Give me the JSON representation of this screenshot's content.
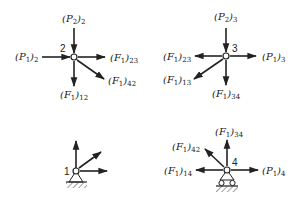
{
  "diagram": {
    "type": "free-body joint diagrams",
    "joints": [
      {
        "id": "2",
        "label": "2",
        "forces": [
          {
            "sym": "P",
            "idx": "2",
            "sub": "2",
            "dir": "in-from-top"
          },
          {
            "sym": "P",
            "idx": "1",
            "sub": "2",
            "dir": "in-from-left"
          },
          {
            "sym": "F",
            "idx": "1",
            "sub": "23",
            "dir": "out-right"
          },
          {
            "sym": "F",
            "idx": "1",
            "sub": "12",
            "dir": "out-down"
          },
          {
            "sym": "F",
            "idx": "1",
            "sub": "42",
            "dir": "out-down-right"
          }
        ]
      },
      {
        "id": "3",
        "label": "3",
        "forces": [
          {
            "sym": "P",
            "idx": "2",
            "sub": "3",
            "dir": "in-from-top"
          },
          {
            "sym": "P",
            "idx": "1",
            "sub": "3",
            "dir": "out-right"
          },
          {
            "sym": "F",
            "idx": "1",
            "sub": "23",
            "dir": "out-left"
          },
          {
            "sym": "F",
            "idx": "1",
            "sub": "13",
            "dir": "out-down-left"
          },
          {
            "sym": "F",
            "idx": "1",
            "sub": "34",
            "dir": "out-down"
          }
        ]
      },
      {
        "id": "1",
        "label": "1",
        "support": "pin",
        "forces": [
          {
            "dir": "out-up"
          },
          {
            "dir": "out-up-right"
          },
          {
            "dir": "out-right"
          }
        ]
      },
      {
        "id": "4",
        "label": "4",
        "support": "roller",
        "forces": [
          {
            "sym": "F",
            "idx": "1",
            "sub": "34",
            "dir": "out-up"
          },
          {
            "sym": "F",
            "idx": "1",
            "sub": "42",
            "dir": "out-up-left"
          },
          {
            "sym": "F",
            "idx": "1",
            "sub": "14",
            "dir": "out-left"
          },
          {
            "sym": "P",
            "idx": "1",
            "sub": "4",
            "dir": "out-right"
          }
        ]
      }
    ]
  }
}
